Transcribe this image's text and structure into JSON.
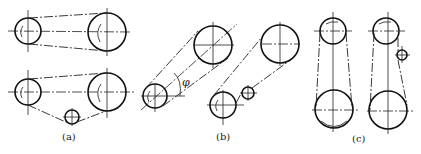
{
  "figure": {
    "colors": {
      "line": "#111111",
      "background": "#ffffff"
    },
    "panels": [
      {
        "id": "a",
        "caption": "(a)",
        "orientation": "horizontal",
        "layouts": [
          {
            "name": "open-belt",
            "pulleys": [
              "small-driver",
              "large-driven"
            ],
            "idler": false
          },
          {
            "name": "open-belt-with-idler",
            "pulleys": [
              "small-driver",
              "large-driven"
            ],
            "idler": true
          }
        ]
      },
      {
        "id": "b",
        "caption": "(b)",
        "orientation": "inclined",
        "angle_label": "φ",
        "layouts": [
          {
            "name": "inclined-belt",
            "pulleys": [
              "small-driver",
              "large-driven"
            ],
            "idler": false
          },
          {
            "name": "inclined-belt-with-idler",
            "pulleys": [
              "small-driver",
              "large-driven"
            ],
            "idler": true
          }
        ]
      },
      {
        "id": "c",
        "caption": "(c)",
        "orientation": "vertical",
        "layouts": [
          {
            "name": "vertical-belt",
            "pulleys": [
              "small-top",
              "large-bottom"
            ],
            "idler": false
          },
          {
            "name": "vertical-belt-with-idler",
            "pulleys": [
              "small-top",
              "large-bottom"
            ],
            "idler": true
          }
        ]
      }
    ]
  }
}
